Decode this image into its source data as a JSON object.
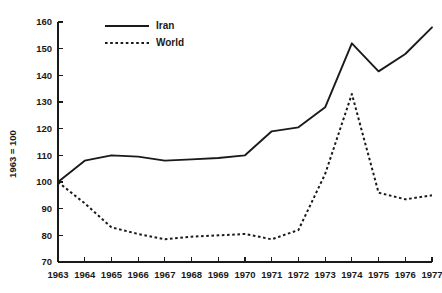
{
  "chart_data": {
    "type": "line",
    "title": "",
    "subtitle": "",
    "xlabel": "",
    "ylabel": "1963 = 100",
    "x": [
      1963,
      1964,
      1965,
      1966,
      1967,
      1968,
      1969,
      1970,
      1971,
      1972,
      1973,
      1974,
      1975,
      1976,
      1977
    ],
    "categories": [
      "1963",
      "1964",
      "1965",
      "1966",
      "1967",
      "1968",
      "1969",
      "1970",
      "1971",
      "1972",
      "1973",
      "1974",
      "1975",
      "1976",
      "1977"
    ],
    "series": [
      {
        "name": "Iran",
        "style": "solid",
        "color": "#1a1a1a",
        "values": [
          100,
          108,
          110,
          109.5,
          108,
          108.5,
          109,
          110,
          119,
          120.5,
          128,
          152,
          141.5,
          148,
          158
        ]
      },
      {
        "name": "World",
        "style": "dotted",
        "color": "#1a1a1a",
        "values": [
          100,
          92,
          83,
          80.5,
          78.5,
          79.5,
          80,
          80.5,
          78.5,
          82,
          103,
          133,
          96,
          93.5,
          95
        ]
      }
    ],
    "ylim": [
      70,
      160
    ],
    "yticks": [
      70,
      80,
      90,
      100,
      110,
      120,
      130,
      140,
      150,
      160
    ],
    "ytick_labels": [
      "70",
      "80",
      "90",
      "100",
      "110",
      "120",
      "130",
      "140",
      "150",
      "160"
    ],
    "xlim": [
      1963,
      1977
    ],
    "xticks": [
      1963,
      1964,
      1965,
      1966,
      1967,
      1968,
      1969,
      1970,
      1971,
      1972,
      1973,
      1974,
      1975,
      1976,
      1977
    ],
    "grid": false,
    "legend_position": "top-left",
    "legend": [
      "Iran",
      "World"
    ],
    "background_color": "#ffffff",
    "axis_color": "#1a1a1a"
  }
}
